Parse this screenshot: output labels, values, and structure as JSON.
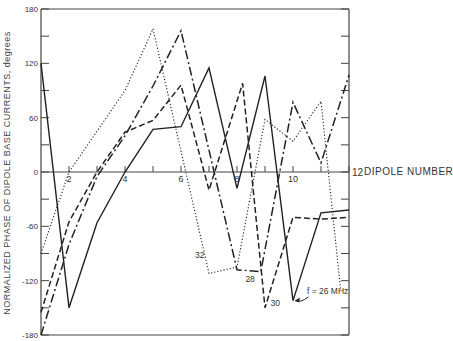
{
  "chart_data": {
    "type": "line",
    "title": "",
    "xlabel": "DIPOLE NUMBER",
    "ylabel": "NORMALIZED PHASE OF DIPOLE BASE CURRENTS, degrees",
    "xlim": [
      1,
      12
    ],
    "ylim": [
      -180,
      180
    ],
    "x_ticks": [
      2,
      4,
      6,
      8,
      10,
      12
    ],
    "x_minor_ticks": [
      3,
      5,
      7,
      9,
      11
    ],
    "y_ticks": [
      180,
      120,
      60,
      0,
      -60,
      -120,
      -180
    ],
    "y_minor_ticks": [
      150,
      90,
      30,
      -30,
      -90,
      -150
    ],
    "grid": false,
    "legend": "inline labels on curves",
    "series": [
      {
        "name": "f = 26 MHz",
        "style": "solid",
        "points": [
          [
            1,
            120
          ],
          [
            2,
            -150
          ],
          [
            3,
            -56
          ],
          [
            4,
            0
          ],
          [
            5,
            47
          ],
          [
            6,
            50
          ],
          [
            7,
            115
          ],
          [
            8,
            -18
          ],
          [
            9,
            106
          ],
          [
            10,
            -142
          ],
          [
            11,
            -45
          ],
          [
            12,
            -42
          ]
        ]
      },
      {
        "name": "28",
        "style": "dash-dot",
        "points": [
          [
            1,
            -180
          ],
          [
            2,
            -80
          ],
          [
            3,
            -5
          ],
          [
            4,
            40
          ],
          [
            5,
            95
          ],
          [
            6,
            156
          ],
          [
            8,
            -108
          ],
          [
            8.85,
            -110
          ],
          [
            10,
            77
          ],
          [
            11,
            10
          ],
          [
            12,
            107
          ]
        ]
      },
      {
        "name": "30",
        "style": "dashed",
        "points": [
          [
            1,
            -155
          ],
          [
            2,
            -55
          ],
          [
            3,
            0
          ],
          [
            4,
            44
          ],
          [
            5,
            57
          ],
          [
            6,
            96
          ],
          [
            7,
            -20
          ],
          [
            8.2,
            98
          ],
          [
            9,
            -150
          ],
          [
            10,
            -50
          ],
          [
            11,
            -52
          ],
          [
            12,
            -50
          ]
        ]
      },
      {
        "name": "32",
        "style": "dotted",
        "points": [
          [
            1,
            -90
          ],
          [
            2,
            0
          ],
          [
            4,
            90
          ],
          [
            5,
            158
          ],
          [
            7,
            -112
          ],
          [
            8,
            -105
          ],
          [
            9,
            58
          ],
          [
            10,
            34
          ],
          [
            11,
            78
          ],
          [
            11.7,
            -130
          ]
        ]
      }
    ],
    "annotations": [
      {
        "text": "32",
        "x": 6.5,
        "y": -95
      },
      {
        "text": "28",
        "x": 8.3,
        "y": -122
      },
      {
        "text": "30",
        "x": 9.2,
        "y": -148
      },
      {
        "text": "f = 26 MHz",
        "x": 10.5,
        "y": -135
      }
    ]
  },
  "labels": {
    "ylabel": "NORMALIZED PHASE OF DIPOLE BASE CURRENTS, degrees",
    "xlabel": "DIPOLE NUMBER"
  }
}
